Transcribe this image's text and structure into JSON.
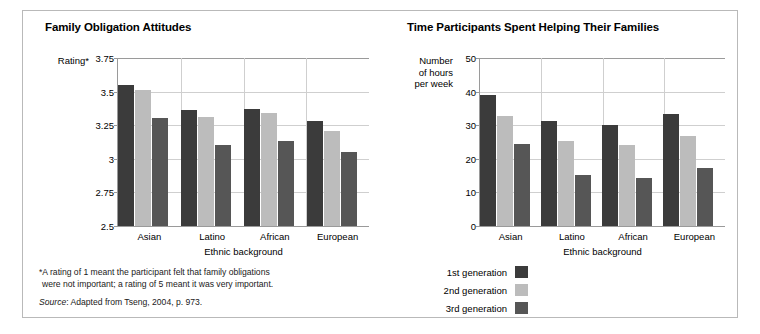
{
  "figure": {
    "footnote_line1": "*A rating of 1 meant the participant felt that family obligations",
    "footnote_line2": "were not important; a rating of 5 meant it was very important.",
    "source_word": "Source",
    "source_text": ": Adapted from Tseng, 2004, p. 973."
  },
  "legend": {
    "items": [
      {
        "label": "1st generation",
        "color": "#3b3b3b"
      },
      {
        "label": "2nd generation",
        "color": "#bcbcbc"
      },
      {
        "label": "3rd generation",
        "color": "#565656"
      }
    ]
  },
  "chart_data": [
    {
      "type": "bar",
      "title": "Family Obligation Attitudes",
      "ylabel": "Rating*",
      "xlabel": "Ethnic background",
      "categories": [
        "Asian",
        "Latino",
        "African",
        "European"
      ],
      "yticks": [
        "3.75",
        "3.5",
        "3.25",
        "3",
        "2.75",
        "2.5"
      ],
      "ytick_values": [
        3.75,
        3.5,
        3.25,
        3,
        2.75,
        2.5
      ],
      "ylim": [
        2.5,
        3.75
      ],
      "grid": true,
      "legend_position": "below-center",
      "series": [
        {
          "name": "1st generation",
          "color": "#3b3b3b",
          "values": [
            3.55,
            3.36,
            3.37,
            3.28
          ]
        },
        {
          "name": "2nd generation",
          "color": "#bcbcbc",
          "values": [
            3.51,
            3.31,
            3.34,
            3.21
          ]
        },
        {
          "name": "3rd generation",
          "color": "#565656",
          "values": [
            3.3,
            3.1,
            3.13,
            3.05
          ]
        }
      ]
    },
    {
      "type": "bar",
      "title": "Time Participants Spent Helping Their Families",
      "ylabel": "Number\nof hours\nper week",
      "xlabel": "Ethnic background",
      "categories": [
        "Asian",
        "Latino",
        "African",
        "European"
      ],
      "yticks": [
        "50",
        "40",
        "30",
        "20",
        "10",
        "0"
      ],
      "ytick_values": [
        50,
        40,
        30,
        20,
        10,
        0
      ],
      "ylim": [
        0,
        50
      ],
      "grid": true,
      "legend_position": "below-center",
      "series": [
        {
          "name": "1st generation",
          "color": "#3b3b3b",
          "values": [
            39.0,
            31.2,
            30.2,
            33.2
          ]
        },
        {
          "name": "2nd generation",
          "color": "#bcbcbc",
          "values": [
            32.7,
            25.2,
            24.1,
            26.8
          ]
        },
        {
          "name": "3rd generation",
          "color": "#565656",
          "values": [
            24.3,
            15.3,
            14.2,
            17.3
          ]
        }
      ]
    }
  ]
}
